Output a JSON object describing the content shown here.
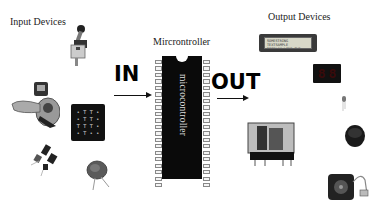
{
  "labels": {
    "input_devices": "Input Devices",
    "microcontroller": "Mircrontroller",
    "output_devices": "Output Devices",
    "in": "IN",
    "out": "OUT",
    "chip_text": "microcontroller"
  },
  "input_devices": [
    {
      "name": "limit-switch",
      "label": "Limit switch"
    },
    {
      "name": "toggle-switch",
      "label": "Toggle switch"
    },
    {
      "name": "keypad",
      "label": "4x4 Keypad"
    },
    {
      "name": "sensors",
      "label": "Sensors"
    },
    {
      "name": "ceramic-disc",
      "label": "Disc component"
    }
  ],
  "output_devices": [
    {
      "name": "lcd-display",
      "label": "LCD display"
    },
    {
      "name": "seven-segment-display",
      "label": "7-segment display"
    },
    {
      "name": "led",
      "label": "LED"
    },
    {
      "name": "relay",
      "label": "Relay"
    },
    {
      "name": "buzzer",
      "label": "Buzzer"
    },
    {
      "name": "motor",
      "label": "Motor"
    }
  ],
  "keypad_keys": [
    "•",
    "T",
    "T",
    "•",
    "•",
    "T",
    "T",
    "•",
    "T",
    "T",
    "T",
    "•",
    "•",
    "T",
    "•",
    "•"
  ],
  "lcd_text": [
    "SOMESTRING TEXTSAMPLE",
    "DISPLAY LINE TWO SET"
  ],
  "sevseg_digits": [
    "8",
    "8"
  ],
  "chip": {
    "pins_per_side": 20
  },
  "colors": {
    "chip": "#0a0a0a",
    "arrow": "#111111",
    "background": "#ffffff"
  }
}
